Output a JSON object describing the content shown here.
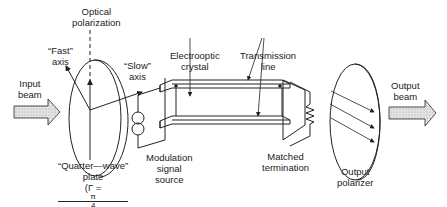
{
  "diagram": {
    "labels": {
      "optical_polarization": [
        "Optical",
        "polarization"
      ],
      "fast_axis": [
        "“Fast”",
        "axis"
      ],
      "slow_axis": [
        "“Slow”",
        "axis"
      ],
      "input_beam": [
        "Input",
        "beam"
      ],
      "electrooptic_crystal": [
        "Electrooptic",
        "crystal"
      ],
      "transmission_line": [
        "Transmission",
        "line"
      ],
      "quarter_wave_plate": [
        "“Quarter—wave”",
        "plate"
      ],
      "retardation": {
        "prefix": "(Γ = ",
        "num": "π",
        "den": "4",
        "suffix": ")"
      },
      "modulation_signal_source": [
        "Modulation",
        "signal",
        "source"
      ],
      "matched_termination": [
        "Matched",
        "termination"
      ],
      "output_polarizer": [
        "Output",
        "polarizer"
      ],
      "output_beam": [
        "Output",
        "beam"
      ]
    },
    "colors": {
      "line": "#222222",
      "arrow_fill": "#d4d4d4"
    }
  }
}
